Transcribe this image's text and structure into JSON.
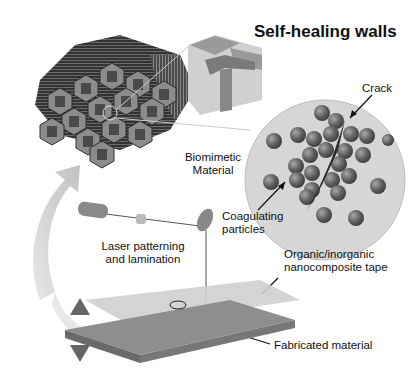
{
  "diagram": {
    "title": "Self-healing walls",
    "labels": {
      "crack": "Crack",
      "biomimetic": [
        "Biomimetic",
        "Material"
      ],
      "coagulating": [
        "Coagulating",
        "particles"
      ],
      "laser": [
        "Laser patterning",
        "and lamination"
      ],
      "tape": [
        "Organic/inorganic",
        "nanocomposite tape"
      ],
      "fabricated": "Fabricated material"
    },
    "components": [
      "hexagonal-honeycomb-structure",
      "wall-junction-zoom-block",
      "magnified-particle-circle",
      "laser-optics-assembly",
      "laminated-tape-stack",
      "cyclic-arrow"
    ],
    "colors": {
      "background": "#ffffff",
      "hex_dark": "#3a3a3a",
      "hex_mid": "#7a7a7a",
      "particle": "#6a6a6a",
      "circle_fill": "#d8d8d8",
      "arrow": "#cfcfcf"
    }
  }
}
